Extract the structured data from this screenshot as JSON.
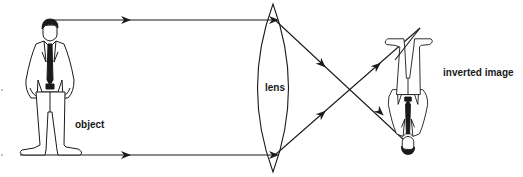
{
  "diagram": {
    "labels": {
      "object": "object",
      "lens": "lens",
      "image": "inverted image"
    },
    "colors": {
      "ink": "#1a1a1a",
      "background": "#ffffff"
    },
    "nodes": [
      {
        "id": "object",
        "label": "object",
        "kind": "upright person figure",
        "x": 50,
        "y_top": 20,
        "y_bottom": 155
      },
      {
        "id": "lens",
        "label": "lens",
        "kind": "biconvex lens",
        "x": 275,
        "y_top": 5,
        "y_bottom": 172
      },
      {
        "id": "image",
        "label": "inverted image",
        "kind": "inverted person figure",
        "x": 408,
        "y_top": 30,
        "y_bottom": 140
      }
    ],
    "rays": [
      {
        "id": "ray-top",
        "from": "object top",
        "path": [
          [
            50,
            20
          ],
          [
            275,
            20
          ],
          [
            405,
            140
          ]
        ],
        "arrows": 2
      },
      {
        "id": "ray-bottom",
        "from": "object bottom",
        "path": [
          [
            20,
            155
          ],
          [
            275,
            155
          ],
          [
            420,
            28
          ]
        ],
        "arrows": 3
      }
    ],
    "crossing_point": [
      355,
      86
    ]
  }
}
